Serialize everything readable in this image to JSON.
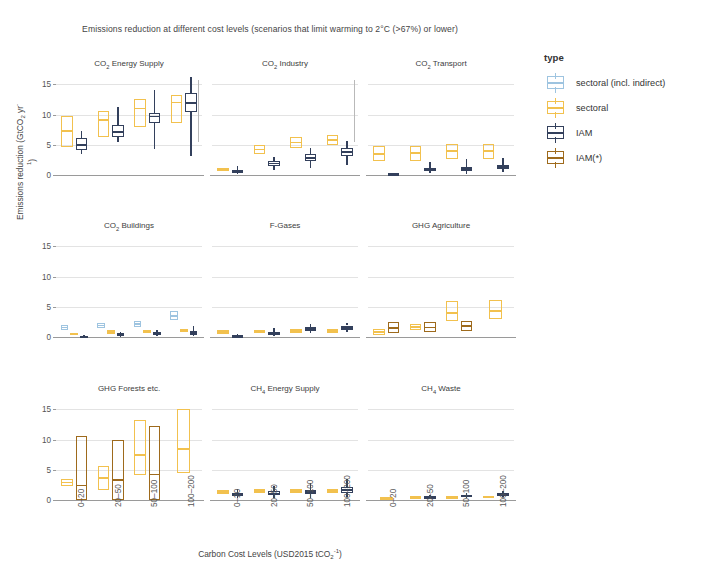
{
  "title_parts": {
    "a": "Emissions reduction at different cost levels (scenarios that limit warming to 2",
    "b": "C (>67%) or lower)"
  },
  "axes": {
    "y_title_a": "Emissions reduction (GtCO",
    "y_title_b": " yr",
    "y_title_c": ")",
    "x_title_a": "Carbon Cost Levels (USD2015 tCO",
    "x_title_b": ")",
    "y_ticks": [
      0,
      5,
      10,
      15
    ],
    "y_min": 0,
    "y_max": 16.2,
    "x_categories": [
      "0–20",
      "20–50",
      "50–100",
      "100–200"
    ]
  },
  "legend": {
    "title": "type",
    "items": [
      {
        "label": "sectoral (incl. indirect)",
        "color": "#9ec4e0",
        "key": "sectoral-indirect"
      },
      {
        "label": "sectoral",
        "color": "#f2c14e",
        "key": "sectoral"
      },
      {
        "label": "IAM",
        "color": "#33405c",
        "key": "iam"
      },
      {
        "label": "IAM(*)",
        "color": "#9e6a1c",
        "key": "iam-star"
      }
    ]
  },
  "colors": {
    "sectoral_indirect": "#9ec4e0",
    "sectoral": "#f2c14e",
    "iam": "#33405c",
    "iam_star": "#9e6a1c",
    "grid": "#e3e3e3",
    "axis": "#9a9a9a"
  },
  "chart_data": {
    "type": "box",
    "title": "Emissions reduction at different cost levels (scenarios that limit warming to 2°C (>67%) or lower)",
    "xlabel": "Carbon Cost Levels (USD2015 tCO2-1)",
    "ylabel": "Emissions reduction (GtCO2 yr-1)",
    "ylim": [
      0,
      16.2
    ],
    "yticks": [
      0,
      5,
      10,
      15
    ],
    "grid": true,
    "legend_position": "right",
    "categories": [
      "0–20",
      "20–50",
      "50–100",
      "100–200"
    ],
    "panels": [
      {
        "name": "CO2 Energy Supply",
        "label_a": "CO",
        "label_b": " Energy Supply",
        "row": 0,
        "col": 0,
        "boxes": [
          {
            "cat": "0–20",
            "type": "sectoral",
            "q1": 4.6,
            "median": 7.3,
            "q3": 9.7,
            "low": 4.6,
            "high": 9.7
          },
          {
            "cat": "0–20",
            "type": "iam",
            "q1": 4.2,
            "median": 5.0,
            "q3": 6.1,
            "low": 3.5,
            "high": 7.3
          },
          {
            "cat": "20–50",
            "type": "sectoral",
            "q1": 6.3,
            "median": 9.1,
            "q3": 10.5,
            "low": 6.3,
            "high": 10.5
          },
          {
            "cat": "20–50",
            "type": "iam",
            "q1": 6.3,
            "median": 7.1,
            "q3": 8.3,
            "low": 5.4,
            "high": 11.3
          },
          {
            "cat": "50–100",
            "type": "sectoral",
            "q1": 8.0,
            "median": 11.0,
            "q3": 12.5,
            "low": 8.0,
            "high": 12.5
          },
          {
            "cat": "50–100",
            "type": "iam",
            "q1": 8.6,
            "median": 9.7,
            "q3": 10.3,
            "low": 4.3,
            "high": 14.0
          },
          {
            "cat": "100–200",
            "type": "sectoral",
            "q1": 8.6,
            "median": 12.0,
            "q3": 13.3,
            "low": 8.6,
            "high": 13.3
          },
          {
            "cat": "100–200",
            "type": "iam",
            "q1": 10.4,
            "median": 11.9,
            "q3": 13.6,
            "low": 3.2,
            "high": 16.2
          }
        ]
      },
      {
        "name": "CO2 Industry",
        "label_a": "CO",
        "label_b": " Industry",
        "row": 0,
        "col": 1,
        "boxes": [
          {
            "cat": "0–20",
            "type": "sectoral",
            "q1": 0.7,
            "median": 0.9,
            "q3": 1.1,
            "low": 0.7,
            "high": 1.1
          },
          {
            "cat": "0–20",
            "type": "iam",
            "q1": 0.4,
            "median": 0.6,
            "q3": 0.8,
            "low": 0.2,
            "high": 1.5
          },
          {
            "cat": "20–50",
            "type": "sectoral",
            "q1": 3.4,
            "median": 4.2,
            "q3": 4.9,
            "low": 3.4,
            "high": 4.9
          },
          {
            "cat": "20–50",
            "type": "iam",
            "q1": 1.5,
            "median": 1.9,
            "q3": 2.3,
            "low": 0.8,
            "high": 3.0
          },
          {
            "cat": "50–100",
            "type": "sectoral",
            "q1": 4.4,
            "median": 5.4,
            "q3": 6.2,
            "low": 4.4,
            "high": 6.2
          },
          {
            "cat": "50–100",
            "type": "iam",
            "q1": 2.3,
            "median": 2.8,
            "q3": 3.4,
            "low": 1.2,
            "high": 4.5
          },
          {
            "cat": "100–200",
            "type": "sectoral",
            "q1": 4.9,
            "median": 5.8,
            "q3": 6.6,
            "low": 4.9,
            "high": 6.6
          },
          {
            "cat": "100–200",
            "type": "iam",
            "q1": 3.2,
            "median": 3.8,
            "q3": 4.5,
            "low": 1.6,
            "high": 5.6
          }
        ]
      },
      {
        "name": "CO2 Transport",
        "label_a": "CO",
        "label_b": " Transport",
        "row": 0,
        "col": 2,
        "boxes": [
          {
            "cat": "0–20",
            "type": "sectoral",
            "q1": 2.3,
            "median": 3.5,
            "q3": 4.8,
            "low": 2.3,
            "high": 4.8
          },
          {
            "cat": "0–20",
            "type": "iam",
            "q1": 0.1,
            "median": 0.2,
            "q3": 0.3,
            "low": 0.1,
            "high": 0.3
          },
          {
            "cat": "20–50",
            "type": "sectoral",
            "q1": 2.3,
            "median": 3.6,
            "q3": 4.8,
            "low": 2.3,
            "high": 4.8
          },
          {
            "cat": "20–50",
            "type": "iam",
            "q1": 0.6,
            "median": 0.8,
            "q3": 1.1,
            "low": 0.3,
            "high": 2.2
          },
          {
            "cat": "50–100",
            "type": "sectoral",
            "q1": 2.6,
            "median": 4.0,
            "q3": 5.2,
            "low": 2.6,
            "high": 5.2
          },
          {
            "cat": "50–100",
            "type": "iam",
            "q1": 0.7,
            "median": 1.0,
            "q3": 1.4,
            "low": 0.2,
            "high": 2.6
          },
          {
            "cat": "100–200",
            "type": "sectoral",
            "q1": 2.6,
            "median": 4.0,
            "q3": 5.2,
            "low": 2.6,
            "high": 5.2
          },
          {
            "cat": "100–200",
            "type": "iam",
            "q1": 1.0,
            "median": 1.3,
            "q3": 1.7,
            "low": 0.5,
            "high": 2.8
          }
        ]
      },
      {
        "name": "CO2 Buildings",
        "label_a": "CO",
        "label_b": " Buildings",
        "row": 1,
        "col": 0,
        "boxes": [
          {
            "cat": "0–20",
            "type": "sectoral-indirect",
            "q1": 1.2,
            "median": 1.6,
            "q3": 2.0,
            "low": 1.2,
            "high": 2.0
          },
          {
            "cat": "0–20",
            "type": "sectoral",
            "q1": 0.3,
            "median": 0.5,
            "q3": 0.7,
            "low": 0.3,
            "high": 0.7
          },
          {
            "cat": "0–20",
            "type": "iam",
            "q1": 0.05,
            "median": 0.1,
            "q3": 0.2,
            "low": 0.05,
            "high": 0.35
          },
          {
            "cat": "20–50",
            "type": "sectoral-indirect",
            "q1": 1.5,
            "median": 1.9,
            "q3": 2.3,
            "low": 1.5,
            "high": 2.3
          },
          {
            "cat": "20–50",
            "type": "sectoral",
            "q1": 0.5,
            "median": 0.8,
            "q3": 1.1,
            "low": 0.5,
            "high": 1.1
          },
          {
            "cat": "20–50",
            "type": "iam",
            "q1": 0.2,
            "median": 0.4,
            "q3": 0.6,
            "low": 0.1,
            "high": 0.9
          },
          {
            "cat": "50–100",
            "type": "sectoral-indirect",
            "q1": 1.7,
            "median": 2.1,
            "q3": 2.6,
            "low": 1.7,
            "high": 2.6
          },
          {
            "cat": "50–100",
            "type": "sectoral",
            "q1": 0.6,
            "median": 0.9,
            "q3": 1.2,
            "low": 0.6,
            "high": 1.2
          },
          {
            "cat": "50–100",
            "type": "iam",
            "q1": 0.3,
            "median": 0.5,
            "q3": 0.8,
            "low": 0.15,
            "high": 1.2
          },
          {
            "cat": "100–200",
            "type": "sectoral-indirect",
            "q1": 2.8,
            "median": 3.5,
            "q3": 4.3,
            "low": 2.8,
            "high": 4.3
          },
          {
            "cat": "100–200",
            "type": "sectoral",
            "q1": 0.8,
            "median": 1.1,
            "q3": 1.4,
            "low": 0.8,
            "high": 1.4
          },
          {
            "cat": "100–200",
            "type": "iam",
            "q1": 0.4,
            "median": 0.7,
            "q3": 1.0,
            "low": 0.2,
            "high": 1.8
          }
        ]
      },
      {
        "name": "F-Gases",
        "label_a": "F-Gases",
        "label_b": "",
        "row": 1,
        "col": 1,
        "boxes": [
          {
            "cat": "0–20",
            "type": "sectoral",
            "q1": 0.5,
            "median": 0.8,
            "q3": 1.1,
            "low": 0.5,
            "high": 1.1
          },
          {
            "cat": "0–20",
            "type": "iam",
            "q1": 0.1,
            "median": 0.2,
            "q3": 0.3,
            "low": 0.05,
            "high": 0.45
          },
          {
            "cat": "20–50",
            "type": "sectoral",
            "q1": 0.6,
            "median": 0.9,
            "q3": 1.2,
            "low": 0.6,
            "high": 1.2
          },
          {
            "cat": "20–50",
            "type": "iam",
            "q1": 0.4,
            "median": 0.6,
            "q3": 0.9,
            "low": 0.15,
            "high": 1.5
          },
          {
            "cat": "50–100",
            "type": "sectoral",
            "q1": 0.7,
            "median": 1.0,
            "q3": 1.3,
            "low": 0.7,
            "high": 1.3
          },
          {
            "cat": "50–100",
            "type": "iam",
            "q1": 1.0,
            "median": 1.3,
            "q3": 1.7,
            "low": 0.6,
            "high": 2.1
          },
          {
            "cat": "100–200",
            "type": "sectoral",
            "q1": 0.7,
            "median": 1.0,
            "q3": 1.3,
            "low": 0.7,
            "high": 1.3
          },
          {
            "cat": "100–200",
            "type": "iam",
            "q1": 1.2,
            "median": 1.5,
            "q3": 1.9,
            "low": 0.8,
            "high": 2.3
          }
        ]
      },
      {
        "name": "GHG Agriculture",
        "label_a": "GHG Agriculture",
        "label_b": "",
        "row": 1,
        "col": 2,
        "boxes": [
          {
            "cat": "0–20",
            "type": "sectoral",
            "q1": 0.4,
            "median": 0.8,
            "q3": 1.3,
            "low": 0.4,
            "high": 1.3
          },
          {
            "cat": "0–20",
            "type": "iam-star",
            "q1": 0.6,
            "median": 1.5,
            "q3": 2.4,
            "low": 0.6,
            "high": 2.4
          },
          {
            "cat": "20–50",
            "type": "sectoral",
            "q1": 1.2,
            "median": 1.7,
            "q3": 2.2,
            "low": 1.2,
            "high": 2.2
          },
          {
            "cat": "20–50",
            "type": "iam-star",
            "q1": 0.8,
            "median": 1.6,
            "q3": 2.5,
            "low": 0.8,
            "high": 2.5
          },
          {
            "cat": "50–100",
            "type": "sectoral",
            "q1": 2.6,
            "median": 4.0,
            "q3": 6.0,
            "low": 2.6,
            "high": 6.0
          },
          {
            "cat": "50–100",
            "type": "iam-star",
            "q1": 1.0,
            "median": 1.8,
            "q3": 2.7,
            "low": 1.0,
            "high": 2.7
          },
          {
            "cat": "100–200",
            "type": "sectoral",
            "q1": 2.9,
            "median": 4.3,
            "q3": 6.1,
            "low": 2.9,
            "high": 6.1
          }
        ]
      },
      {
        "name": "GHG Forests etc.",
        "label_a": "GHG Forests etc.",
        "label_b": "",
        "row": 2,
        "col": 0,
        "boxes": [
          {
            "cat": "0–20",
            "type": "sectoral",
            "q1": 2.3,
            "median": 2.9,
            "q3": 3.5,
            "low": 2.3,
            "high": 3.5
          },
          {
            "cat": "0–20",
            "type": "iam-star",
            "q1": 0.0,
            "median": 2.4,
            "q3": 10.6,
            "low": 0.0,
            "high": 10.6
          },
          {
            "cat": "20–50",
            "type": "sectoral",
            "q1": 1.7,
            "median": 3.6,
            "q3": 5.6,
            "low": 1.7,
            "high": 5.6
          },
          {
            "cat": "20–50",
            "type": "iam-star",
            "q1": 0.0,
            "median": 3.3,
            "q3": 10.0,
            "low": 0.0,
            "high": 10.0
          },
          {
            "cat": "50–100",
            "type": "sectoral",
            "q1": 4.1,
            "median": 7.4,
            "q3": 13.2,
            "low": 4.1,
            "high": 13.2
          },
          {
            "cat": "50–100",
            "type": "iam-star",
            "q1": 0.0,
            "median": 4.2,
            "q3": 12.2,
            "low": 0.0,
            "high": 12.2
          },
          {
            "cat": "100–200",
            "type": "sectoral",
            "q1": 4.4,
            "median": 8.4,
            "q3": 15.0,
            "low": 4.4,
            "high": 15.0
          }
        ]
      },
      {
        "name": "CH4 Energy Supply",
        "label_a": "CH",
        "label_b": " Energy Supply",
        "row": 2,
        "col": 1,
        "boxes": [
          {
            "cat": "0–20",
            "type": "sectoral",
            "q1": 1.0,
            "median": 1.3,
            "q3": 1.7,
            "low": 1.0,
            "high": 1.7
          },
          {
            "cat": "0–20",
            "type": "iam",
            "q1": 0.7,
            "median": 0.9,
            "q3": 1.2,
            "low": 0.4,
            "high": 1.9
          },
          {
            "cat": "20–50",
            "type": "sectoral",
            "q1": 1.1,
            "median": 1.5,
            "q3": 1.9,
            "low": 1.1,
            "high": 1.9
          },
          {
            "cat": "20–50",
            "type": "iam",
            "q1": 0.8,
            "median": 1.1,
            "q3": 1.5,
            "low": 0.4,
            "high": 2.3
          },
          {
            "cat": "50–100",
            "type": "sectoral",
            "q1": 1.1,
            "median": 1.5,
            "q3": 1.9,
            "low": 1.1,
            "high": 1.9
          },
          {
            "cat": "50–100",
            "type": "iam",
            "q1": 1.0,
            "median": 1.3,
            "q3": 1.7,
            "low": 0.4,
            "high": 2.8
          },
          {
            "cat": "100–200",
            "type": "sectoral",
            "q1": 1.1,
            "median": 1.5,
            "q3": 1.9,
            "low": 1.1,
            "high": 1.9
          },
          {
            "cat": "100–200",
            "type": "iam",
            "q1": 1.2,
            "median": 1.7,
            "q3": 2.2,
            "low": 0.5,
            "high": 3.4
          }
        ]
      },
      {
        "name": "CH4 Waste",
        "label_a": "CH",
        "label_b": " Waste",
        "row": 2,
        "col": 2,
        "boxes": [
          {
            "cat": "0–20",
            "type": "sectoral",
            "q1": 0.15,
            "median": 0.3,
            "q3": 0.45,
            "low": 0.15,
            "high": 0.45
          },
          {
            "cat": "20–50",
            "type": "sectoral",
            "q1": 0.3,
            "median": 0.45,
            "q3": 0.6,
            "low": 0.3,
            "high": 0.6
          },
          {
            "cat": "20–50",
            "type": "iam",
            "q1": 0.3,
            "median": 0.45,
            "q3": 0.65,
            "low": 0.2,
            "high": 0.8
          },
          {
            "cat": "50–100",
            "type": "sectoral",
            "q1": 0.35,
            "median": 0.5,
            "q3": 0.65,
            "low": 0.35,
            "high": 0.65
          },
          {
            "cat": "50–100",
            "type": "iam",
            "q1": 0.5,
            "median": 0.7,
            "q3": 0.9,
            "low": 0.3,
            "high": 1.1
          },
          {
            "cat": "100–200",
            "type": "sectoral",
            "q1": 0.4,
            "median": 0.55,
            "q3": 0.7,
            "low": 0.4,
            "high": 0.7
          },
          {
            "cat": "100–200",
            "type": "iam",
            "q1": 0.7,
            "median": 0.95,
            "q3": 1.2,
            "low": 0.45,
            "high": 1.45
          }
        ]
      }
    ]
  }
}
